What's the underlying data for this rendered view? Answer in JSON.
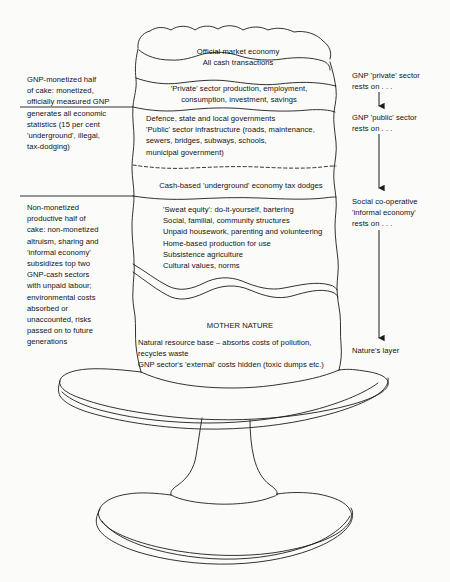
{
  "diagram": {
    "ink_color": "#1a1a1a",
    "background_color": "#fbfbfa"
  },
  "cake_layers": [
    {
      "id": "top",
      "name": "official-market-economy",
      "text": "Official market economy\nAll cash transactions",
      "align": "center"
    },
    {
      "id": "private",
      "name": "private-sector",
      "text": "'Private' sector production, employment,\nconsumption, investment, savings",
      "align": "center"
    },
    {
      "id": "public",
      "name": "public-sector",
      "text": "Defence, state and local governments\n'Public' sector infrastructure (roads, maintenance,\nsewers, bridges, subways, schools,\nmunicipal government)",
      "align": "left"
    },
    {
      "id": "cash",
      "name": "underground-economy",
      "text": "Cash-based 'underground' economy tax dodges",
      "align": "center"
    },
    {
      "id": "informal",
      "name": "informal-economy",
      "text": "'Sweat equity': do-it-yourself, bartering\nSocial, familial, community structures\nUnpaid housework, parenting and volunteering\nHome-based production for use\nSubsistence agriculture\nCultural values, norms",
      "align": "left"
    },
    {
      "id": "mother-nature-title",
      "name": "mother-nature-title",
      "text": "MOTHER NATURE",
      "align": "center"
    },
    {
      "id": "mother-nature-body",
      "name": "mother-nature-body",
      "text": "Natural resource base – absorbs costs of pollution,\n    recycles waste\nGNP sector's 'external' costs hidden (toxic dumps etc.)",
      "align": "left"
    }
  ],
  "left_annotations": [
    {
      "name": "gnp-monetized-half-note",
      "text": "GNP-monetized half\nof cake: monetized,\nofficially measured GNP\ngenerates all economic\nstatistics (15 per cent\n'underground', illegal,\ntax-dodging)"
    },
    {
      "name": "non-monetized-half-note",
      "text": "Non-monetized\nproductive half of\ncake: non-monetized\naltruism, sharing and\n'informal economy'\nsubsidizes top two\nGNP-cash  sectors\nwith unpaid  labour;\nenvironmental costs\nabsorbed or\nunaccounted, risks\npassed on to future\ngenerations"
    }
  ],
  "right_annotations": [
    {
      "name": "private-rests-on-note",
      "text": "GNP 'private' sector\nrests on . . ."
    },
    {
      "name": "public-rests-on-note",
      "text": "GNP 'public' sector\nrests on . . ."
    },
    {
      "name": "informal-rests-on-note",
      "text": "Social co-operative\n'informal economy'\nrests on . . ."
    },
    {
      "name": "natures-layer-note",
      "text": "Nature's layer"
    }
  ]
}
